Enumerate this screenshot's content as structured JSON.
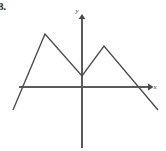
{
  "figure": {
    "label": "8.",
    "background_color": "#ffffff",
    "width": 166,
    "height": 151
  },
  "axes": {
    "x": {
      "label": "x",
      "color": "#5a5a5a",
      "start_px": [
        19,
        87
      ],
      "end_px": [
        150,
        87
      ],
      "arrow": "right-arrow-icon",
      "label_pos_px": [
        155,
        89
      ]
    },
    "y": {
      "label": "y",
      "color": "#5a5a5a",
      "start_px": [
        82,
        148
      ],
      "end_px": [
        82,
        17
      ],
      "arrow": "up-arrow-icon",
      "label_pos_px": [
        77,
        13
      ]
    },
    "origin_px": [
      82,
      87
    ]
  },
  "chart_data": {
    "type": "line",
    "title": "",
    "subtitle": "",
    "xlabel": "x",
    "ylabel": "y",
    "grid": false,
    "legend": null,
    "curve_color": "#4a4a4a",
    "units": "pixels",
    "points_px": [
      [
        13,
        110
      ],
      [
        45,
        34
      ],
      [
        82,
        76
      ],
      [
        104,
        46
      ],
      [
        158,
        110
      ]
    ],
    "vertices": [
      {
        "name": "left-endpoint",
        "x_px": 13,
        "y_px": 110,
        "x": -3.45,
        "y": -0.92
      },
      {
        "name": "left-peak",
        "x_px": 45,
        "y_px": 34,
        "x": -1.85,
        "y": 2.65
      },
      {
        "name": "valley",
        "x_px": 82,
        "y_px": 76,
        "x": 0.0,
        "y": 0.55
      },
      {
        "name": "right-peak",
        "x_px": 104,
        "y_px": 46,
        "x": 1.1,
        "y": 2.05
      },
      {
        "name": "right-endpoint",
        "x_px": 158,
        "y_px": 110,
        "x": 3.8,
        "y": -0.92
      }
    ],
    "x": [
      -3.45,
      -1.85,
      0.0,
      1.1,
      3.8
    ],
    "values": [
      -0.92,
      2.65,
      0.55,
      2.05,
      -0.92
    ],
    "xlim": [
      -3.45,
      3.8
    ],
    "ylim": [
      -1.2,
      3.0
    ]
  }
}
